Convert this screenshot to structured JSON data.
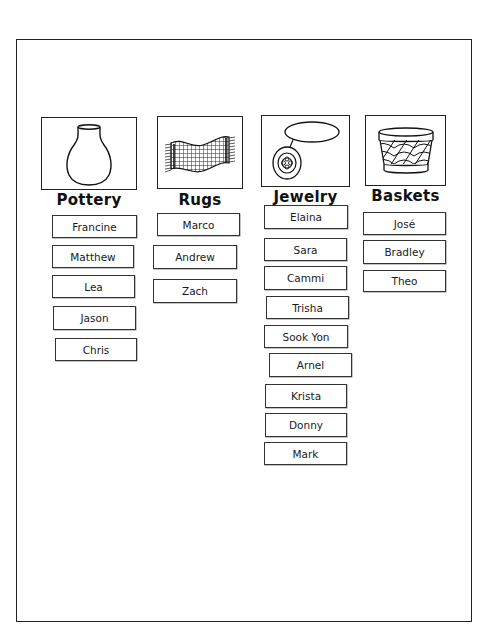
{
  "categories": [
    {
      "label": "Pottery",
      "icon": "vase-icon",
      "names": [
        "Francine",
        "Matthew",
        "Lea",
        "Jason",
        "Chris"
      ]
    },
    {
      "label": "Rugs",
      "icon": "rug-icon",
      "names": [
        "Marco",
        "Andrew",
        "Zach"
      ]
    },
    {
      "label": "Jewelry",
      "icon": "pendant-necklace-icon",
      "names": [
        "Elaina",
        "Sara",
        "Cammi",
        "Trisha",
        "Sook Yon",
        "Arnel",
        "Krista",
        "Donny",
        "Mark"
      ]
    },
    {
      "label": "Baskets",
      "icon": "basket-icon",
      "names": [
        "José",
        "Bradley",
        "Theo"
      ]
    }
  ]
}
